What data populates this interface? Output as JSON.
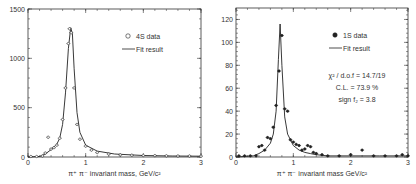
{
  "chart_data": [
    {
      "type": "line",
      "panel": "left",
      "xlabel": "π⁺ π⁻ invariant mass, GeV/c²",
      "ylabel": "",
      "xlim": [
        0,
        3
      ],
      "ylim": [
        0,
        1500
      ],
      "xticks": [
        "0",
        "1",
        "2",
        "3"
      ],
      "yticks": [
        "0",
        "500",
        "1000",
        "1500"
      ],
      "legend": [
        {
          "marker": "open-circle",
          "label": "4S data"
        },
        {
          "marker": "line",
          "label": "Fit result"
        }
      ],
      "series": [
        {
          "name": "4S data",
          "x": [
            0.05,
            0.15,
            0.25,
            0.3,
            0.35,
            0.4,
            0.45,
            0.5,
            0.55,
            0.6,
            0.65,
            0.7,
            0.72,
            0.75,
            0.8,
            0.85,
            0.9,
            1.0,
            1.1,
            1.2,
            1.4,
            1.6,
            1.8,
            2.0,
            2.2,
            2.4,
            2.6,
            2.8,
            3.0
          ],
          "y": [
            5,
            5,
            10,
            40,
            200,
            80,
            95,
            120,
            190,
            380,
            700,
            1150,
            1300,
            1260,
            700,
            330,
            180,
            110,
            70,
            45,
            30,
            22,
            18,
            15,
            14,
            12,
            10,
            10,
            8
          ]
        },
        {
          "name": "Fit result",
          "x": [
            0.0,
            0.2,
            0.3,
            0.4,
            0.5,
            0.55,
            0.6,
            0.65,
            0.7,
            0.74,
            0.77,
            0.8,
            0.85,
            0.9,
            1.0,
            1.2,
            1.5,
            2.0,
            2.5,
            3.0
          ],
          "y": [
            0,
            5,
            30,
            75,
            130,
            190,
            330,
            650,
            1100,
            1310,
            1250,
            900,
            450,
            250,
            120,
            60,
            30,
            15,
            10,
            8
          ]
        }
      ]
    },
    {
      "type": "line",
      "panel": "right",
      "xlabel": "π⁺ π⁻ invariant mass GeV/c²",
      "ylabel": "",
      "xlim": [
        0,
        3
      ],
      "ylim": [
        0,
        130
      ],
      "xticks": [
        "0",
        "1",
        "2",
        "3"
      ],
      "yticks": [
        "0",
        "20",
        "40",
        "60",
        "80",
        "100",
        "120"
      ],
      "legend": [
        {
          "marker": "filled-circle",
          "label": "1S data"
        },
        {
          "marker": "line",
          "label": "Fit result"
        }
      ],
      "annotations": [
        "χ² / d.o.f = 14.7/19",
        "C.L. = 73.9 %",
        "sign f₂ = 3.8"
      ],
      "series": [
        {
          "name": "1S data",
          "x": [
            0.05,
            0.15,
            0.25,
            0.35,
            0.4,
            0.45,
            0.5,
            0.55,
            0.6,
            0.65,
            0.7,
            0.75,
            0.8,
            0.85,
            0.9,
            0.95,
            1.0,
            1.05,
            1.1,
            1.15,
            1.2,
            1.25,
            1.3,
            1.35,
            1.4,
            1.5,
            1.6,
            1.8,
            2.0,
            2.2,
            2.4,
            2.6,
            2.8,
            2.9,
            3.0
          ],
          "y": [
            1,
            1,
            1,
            1,
            9,
            10,
            6,
            17,
            16,
            26,
            45,
            75,
            106,
            42,
            40,
            15,
            13,
            11,
            10,
            6,
            7,
            10,
            9,
            4,
            3,
            2,
            1,
            1,
            2,
            6,
            1,
            1,
            1,
            2,
            1
          ]
        },
        {
          "name": "Fit result",
          "x": [
            0.0,
            0.3,
            0.4,
            0.5,
            0.6,
            0.65,
            0.7,
            0.74,
            0.77,
            0.8,
            0.85,
            0.9,
            1.0,
            1.1,
            1.2,
            1.3,
            1.4,
            1.6,
            2.0,
            2.5,
            3.0
          ],
          "y": [
            0,
            1,
            3,
            6,
            12,
            20,
            40,
            85,
            116,
            80,
            35,
            20,
            10,
            6,
            4,
            3,
            2,
            1,
            1,
            1,
            1
          ]
        }
      ]
    }
  ]
}
